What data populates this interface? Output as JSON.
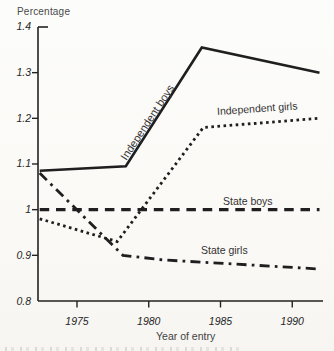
{
  "chart_data": {
    "type": "line",
    "title": "",
    "ylabel": "Percentage",
    "xlabel": "Year of entry",
    "ylim": [
      0.8,
      1.4
    ],
    "xlim": [
      1972.3,
      1992.1
    ],
    "grid": false,
    "legend": "inline-labels-on-chart",
    "y_ticks": [
      1.4,
      1.3,
      1.2,
      1.1,
      1,
      0.9,
      0.8
    ],
    "y_tick_labels": [
      "1.4",
      "1.3",
      "1.2",
      "1.1",
      "1",
      "0.9",
      "0.8"
    ],
    "x_ticks": [
      1975,
      1980,
      1985,
      1990
    ],
    "x_tick_labels": [
      "1975",
      "1980",
      "1985",
      "1990"
    ],
    "line_color": "#1f1f1f",
    "series": [
      {
        "name": "Independent boys",
        "line_style": "solid",
        "points": [
          [
            1972.4,
            1.085
          ],
          [
            1978.4,
            1.095
          ],
          [
            1983.7,
            1.355
          ],
          [
            1991.9,
            1.3
          ]
        ]
      },
      {
        "name": "Independent girls",
        "line_style": "dotted",
        "points": [
          [
            1972.4,
            0.98
          ],
          [
            1977.8,
            0.93
          ],
          [
            1983.8,
            1.18
          ],
          [
            1991.9,
            1.2
          ]
        ]
      },
      {
        "name": "State boys",
        "line_style": "dashed",
        "points": [
          [
            1972.4,
            1.0
          ],
          [
            1991.9,
            1.0
          ]
        ]
      },
      {
        "name": "State girls",
        "line_style": "dash-dot",
        "points": [
          [
            1972.4,
            1.08
          ],
          [
            1978.2,
            0.9
          ],
          [
            1981.0,
            0.89
          ],
          [
            1991.9,
            0.87
          ]
        ]
      }
    ]
  }
}
